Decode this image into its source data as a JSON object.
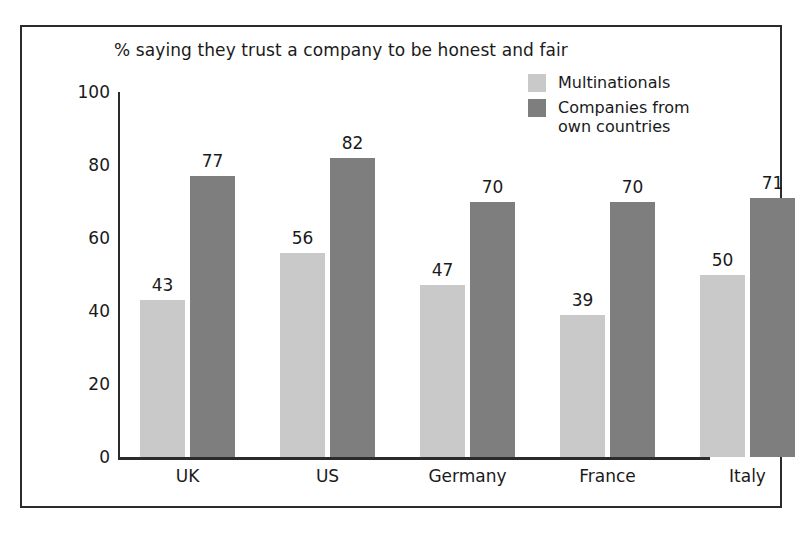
{
  "figure": {
    "frame_color": "#2b2b2b",
    "background": "#ffffff"
  },
  "title": "% saying they trust a company to be honest and fair",
  "legend": {
    "position": "top-right",
    "items": [
      {
        "label": "Multinationals",
        "color": "#c9c9c9"
      },
      {
        "label": "Companies from\nown countries",
        "color": "#7e7e7e"
      }
    ]
  },
  "axis": {
    "y_ticks": [
      "100",
      "80",
      "60",
      "40",
      "20",
      "0"
    ],
    "y_min": 0,
    "y_max": 100
  },
  "chart_data": {
    "type": "bar",
    "title": "% saying they trust a company to be honest and fair",
    "xlabel": "",
    "ylabel": "",
    "ylim": [
      0,
      100
    ],
    "yticks": [
      0,
      20,
      40,
      60,
      80,
      100
    ],
    "grid": false,
    "legend_position": "top-right",
    "categories": [
      "UK",
      "US",
      "Germany",
      "France",
      "Italy",
      "Spain"
    ],
    "series": [
      {
        "name": "Multinationals",
        "color": "#c9c9c9",
        "values": [
          43,
          56,
          47,
          39,
          50,
          45
        ]
      },
      {
        "name": "Companies from own countries",
        "color": "#7e7e7e",
        "values": [
          77,
          82,
          70,
          70,
          71,
          67
        ]
      }
    ]
  }
}
